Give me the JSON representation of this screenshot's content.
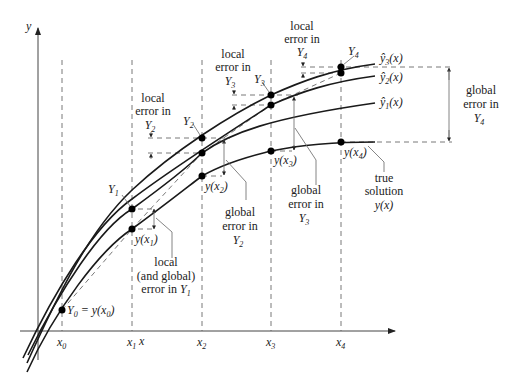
{
  "diagram": {
    "axes": {
      "x_label": "x",
      "y_label": "y"
    },
    "x_ticks": [
      "x0",
      "x1",
      "x2",
      "x3",
      "x4"
    ],
    "x_tick_labels": [
      {
        "base": "x",
        "sub": "0"
      },
      {
        "base": "x",
        "sub": "1"
      },
      {
        "base": "x",
        "sub": "2"
      },
      {
        "base": "x",
        "sub": "3"
      },
      {
        "base": "x",
        "sub": "4"
      }
    ],
    "curves": [
      {
        "name": "y3-hat",
        "label_base": "ŷ",
        "label_sub": "3",
        "label_tail": "(x)"
      },
      {
        "name": "y2-hat",
        "label_base": "ŷ",
        "label_sub": "2",
        "label_tail": "(x)"
      },
      {
        "name": "y1-hat",
        "label_base": "ŷ",
        "label_sub": "1",
        "label_tail": "(x)"
      },
      {
        "name": "true",
        "label": "y(x)"
      }
    ],
    "points": {
      "Y0": {
        "text_a": "Y",
        "sub_a": "0",
        "text_b": " = y(x",
        "sub_b": "0",
        "text_c": ")"
      },
      "Y1": {
        "base": "Y",
        "sub": "1"
      },
      "Y2": {
        "base": "Y",
        "sub": "2"
      },
      "Y3": {
        "base": "Y",
        "sub": "3"
      },
      "Y4": {
        "base": "Y",
        "sub": "4"
      },
      "yx1": {
        "base": "y(x",
        "sub": "1",
        "tail": ")"
      },
      "yx2": {
        "base": "y(x",
        "sub": "2",
        "tail": ")"
      },
      "yx3": {
        "base": "y(x",
        "sub": "3",
        "tail": ")"
      },
      "yx4": {
        "base": "y(x",
        "sub": "4",
        "tail": ")"
      }
    },
    "annotations": {
      "local_Y2": {
        "line1": "local",
        "line2": "error in",
        "base": "Y",
        "sub": "2"
      },
      "local_Y3": {
        "line1": "local",
        "line2": "error in",
        "base": "Y",
        "sub": "3"
      },
      "local_Y4": {
        "line1": "local",
        "line2": "error in",
        "base": "Y",
        "sub": "4"
      },
      "local_Y1": {
        "line1": "local",
        "line2": "(and global)",
        "line3": "error in ",
        "base": "Y",
        "sub": "1"
      },
      "global_Y2": {
        "line1": "global",
        "line2": "error in",
        "base": "Y",
        "sub": "2"
      },
      "global_Y3": {
        "line1": "global",
        "line2": "error in",
        "base": "Y",
        "sub": "3"
      },
      "global_Y4": {
        "line1": "global",
        "line2": "error in",
        "base": "Y",
        "sub": "4"
      },
      "true_solution": {
        "line1": "true",
        "line2": "solution",
        "line3": "y(x)"
      }
    }
  }
}
